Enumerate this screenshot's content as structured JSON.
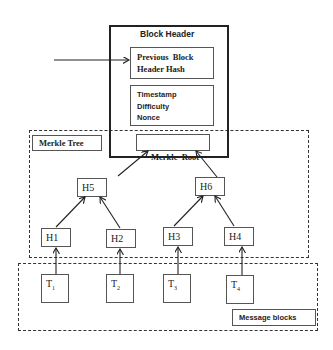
{
  "block_header": {
    "title": "Block Header",
    "prev_hash_line1": "Previous  Block",
    "prev_hash_line2": "Header Hash",
    "fields": [
      "Timestamp",
      "Difficulty",
      "Nonce"
    ],
    "merkle_root": "Merkle  Root"
  },
  "merkle_tree": {
    "label": "Merkle Tree",
    "level2": [
      "H5",
      "H6"
    ],
    "level1": [
      "H1",
      "H2",
      "H3",
      "H4"
    ]
  },
  "message_blocks": {
    "label": "Message blocks",
    "items": [
      {
        "base": "T",
        "sub": "1"
      },
      {
        "base": "T",
        "sub": "2"
      },
      {
        "base": "T",
        "sub": "3"
      },
      {
        "base": "T",
        "sub": "4"
      }
    ]
  }
}
